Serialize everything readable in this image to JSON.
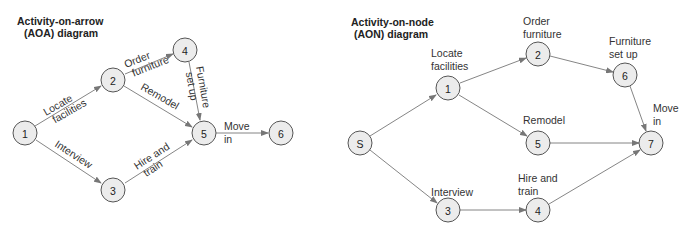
{
  "aoa": {
    "title_line1": "Activity-on-arrow",
    "title_line2": "(AOA) diagram",
    "nodes": [
      {
        "id": "1",
        "x": 25,
        "y": 133
      },
      {
        "id": "2",
        "x": 113,
        "y": 80
      },
      {
        "id": "4",
        "x": 185,
        "y": 50
      },
      {
        "id": "5",
        "x": 204,
        "y": 133
      },
      {
        "id": "6",
        "x": 281,
        "y": 133
      },
      {
        "id": "3",
        "x": 113,
        "y": 190
      }
    ],
    "edges": [
      {
        "from": "1",
        "to": "2",
        "label_line1": "Locate",
        "label_line2": "facilities"
      },
      {
        "from": "1",
        "to": "3",
        "label_line1": "Interview",
        "label_line2": ""
      },
      {
        "from": "2",
        "to": "4",
        "label_line1": "Order",
        "label_line2": "furniture"
      },
      {
        "from": "2",
        "to": "5",
        "label_line1": "Remodel",
        "label_line2": ""
      },
      {
        "from": "4",
        "to": "5",
        "label_line1": "Furniture",
        "label_line2": "set up"
      },
      {
        "from": "3",
        "to": "5",
        "label_line1": "Hire and",
        "label_line2": "train"
      },
      {
        "from": "5",
        "to": "6",
        "label_line1": "Move",
        "label_line2": "in"
      }
    ]
  },
  "aon": {
    "title_line1": "Activity-on-node",
    "title_line2": "(AON) diagram",
    "nodes": [
      {
        "id": "S",
        "x": 360,
        "y": 143,
        "label_line1": "",
        "label_line2": ""
      },
      {
        "id": "1",
        "x": 448,
        "y": 88,
        "label_line1": "Locate",
        "label_line2": "facilities"
      },
      {
        "id": "2",
        "x": 538,
        "y": 54,
        "label_line1": "Order",
        "label_line2": "furniture"
      },
      {
        "id": "6",
        "x": 625,
        "y": 75,
        "label_line1": "Furniture",
        "label_line2": "set up"
      },
      {
        "id": "5",
        "x": 538,
        "y": 143,
        "label_line1": "Remodel",
        "label_line2": ""
      },
      {
        "id": "7",
        "x": 651,
        "y": 143,
        "label_line1": "Move",
        "label_line2": "in"
      },
      {
        "id": "3",
        "x": 448,
        "y": 210,
        "label_line1": "Interview",
        "label_line2": ""
      },
      {
        "id": "4",
        "x": 538,
        "y": 210,
        "label_line1": "Hire and",
        "label_line2": "train"
      }
    ],
    "edges": [
      {
        "from": "S",
        "to": "1"
      },
      {
        "from": "S",
        "to": "3"
      },
      {
        "from": "1",
        "to": "2"
      },
      {
        "from": "1",
        "to": "5"
      },
      {
        "from": "2",
        "to": "6"
      },
      {
        "from": "6",
        "to": "7"
      },
      {
        "from": "5",
        "to": "7"
      },
      {
        "from": "3",
        "to": "4"
      },
      {
        "from": "4",
        "to": "7"
      }
    ]
  }
}
